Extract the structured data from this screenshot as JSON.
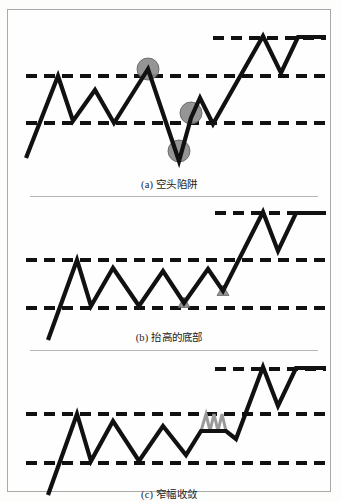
{
  "figure": {
    "title_visible": false,
    "background_color": "#fdfdfc",
    "frame_color": "#a9a9a9",
    "line_color": "#111111",
    "marker_color": "#8c8c8c",
    "marker_stroke": "#5a5a5a",
    "narrow_zigzag_color": "#9a9a9a"
  },
  "panels": [
    {
      "id": "a",
      "caption": "(a) 空头陷阱",
      "caption_label": "(a)",
      "caption_text": "空头陷阱",
      "markers": [
        {
          "type": "circle",
          "cx": 140,
          "cy": 59,
          "r": 11
        },
        {
          "type": "circle",
          "cx": 183,
          "cy": 103,
          "r": 11
        },
        {
          "type": "circle",
          "cx": 171,
          "cy": 141,
          "r": 11
        }
      ],
      "lines": [
        {
          "name": "upper-breakout-line",
          "y": 28,
          "x1": 205,
          "x2": 318
        },
        {
          "name": "resistance-line",
          "y": 66,
          "x1": 18,
          "x2": 318
        },
        {
          "name": "support-line",
          "y": 113,
          "x1": 18,
          "x2": 318
        }
      ],
      "price_path": "18,148 50,66 65,111 87,80 106,113 140,59 171,151 183,108 192,88 205,114 255,26 273,63 290,27 318,27"
    },
    {
      "id": "b",
      "caption": "(b) 抬高的底部",
      "caption_label": "(b)",
      "caption_text": "抬高的底部",
      "markers": [
        {
          "type": "triangle",
          "cx": 176,
          "cy": 105,
          "r": 6
        },
        {
          "type": "triangle",
          "cx": 215,
          "cy": 93,
          "r": 6
        }
      ],
      "lines": [
        {
          "name": "upper-breakout-line",
          "y": 15,
          "x1": 207,
          "x2": 318
        },
        {
          "name": "resistance-line",
          "y": 62,
          "x1": 18,
          "x2": 318
        },
        {
          "name": "support-line",
          "y": 110,
          "x1": 18,
          "x2": 318
        }
      ],
      "price_path": "40,142 69,62 83,108 105,70 131,108 155,73 176,105 200,71 215,93 255,14 270,53 288,15 318,15"
    },
    {
      "id": "c",
      "caption": "(c) 窄幅收敛",
      "caption_label": "(c)",
      "caption_text": "窄幅收敛",
      "markers": [],
      "narrow_zigzag": "193,78 198,61 202,78 206,61 210,78 214,61 218,78",
      "lines": [
        {
          "name": "upper-breakout-line",
          "y": 16,
          "x1": 207,
          "x2": 318
        },
        {
          "name": "resistance-line",
          "y": 61,
          "x1": 18,
          "x2": 318
        },
        {
          "name": "support-line",
          "y": 110,
          "x1": 18,
          "x2": 318
        }
      ],
      "price_path": "40,142 69,61 83,108 105,68 131,108 155,73 178,102 193,78 218,78 228,86 255,14 270,53 288,15 318,15"
    }
  ]
}
